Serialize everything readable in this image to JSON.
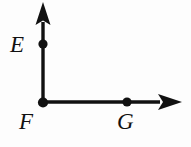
{
  "figure": {
    "type": "geometric-diagram",
    "background_color": "#fdfdfd",
    "stroke_color": "#111111",
    "labels": {
      "E": "E",
      "F": "F",
      "G": "G"
    },
    "points": [
      {
        "name": "E",
        "label": "E",
        "x": 43,
        "y": 44,
        "radius": 4.5,
        "on": "vertical-ray"
      },
      {
        "name": "F",
        "label": "F",
        "x": 43,
        "y": 102,
        "radius": 5.0,
        "on": "vertex"
      },
      {
        "name": "G",
        "label": "G",
        "x": 127,
        "y": 102,
        "radius": 4.5,
        "on": "horizontal-ray"
      }
    ],
    "rays": [
      {
        "name": "vertical-ray",
        "from": {
          "x": 43,
          "y": 102
        },
        "to": {
          "x": 43,
          "y": 3
        },
        "arrow_at": "to",
        "stroke_width": 3.4
      },
      {
        "name": "horizontal-ray",
        "from": {
          "x": 43,
          "y": 102
        },
        "to": {
          "x": 181,
          "y": 102
        },
        "arrow_at": "to",
        "stroke_width": 3.4
      }
    ],
    "arrowheads": [
      {
        "name": "up-arrowhead",
        "tip_x": 43,
        "tip_y": 2,
        "direction": "up"
      },
      {
        "name": "right-arrowhead",
        "tip_x": 182,
        "tip_y": 102,
        "direction": "right"
      }
    ]
  }
}
